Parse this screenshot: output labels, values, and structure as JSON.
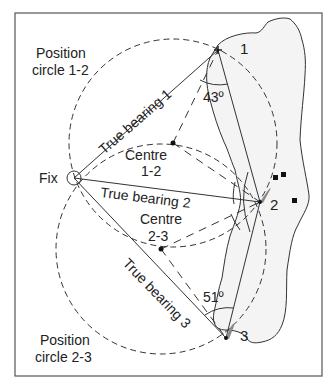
{
  "diagram": {
    "labels": {
      "position_circle_12": [
        "Position",
        "circle 1-2"
      ],
      "position_circle_23": [
        "Position",
        "circle 2-3"
      ],
      "fix": "Fix",
      "centre_12": [
        "Centre",
        "1-2"
      ],
      "centre_23": [
        "Centre",
        "2-3"
      ],
      "bearing_1": "True bearing 1",
      "bearing_2": "True bearing 2",
      "bearing_3": "True bearing 3",
      "angle_12": "43º",
      "angle_23": "51º",
      "point_1": "1",
      "point_2": "2",
      "point_3": "3"
    },
    "colors": {
      "line": "#333333",
      "island_fill": "#f4f4f4",
      "marker_grey": "#8a8a8a"
    }
  }
}
